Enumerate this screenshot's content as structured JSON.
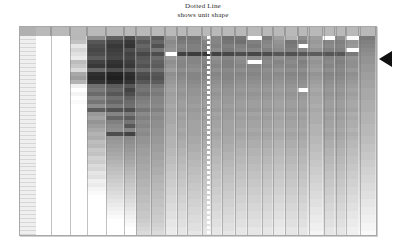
{
  "title": {
    "line1": "Dotted Line",
    "line2": "shows unit shape"
  },
  "marker": {
    "name": "selected-row-pointer",
    "shape": "left-pointing-triangle",
    "color": "#111111",
    "points_at_row_index": 4
  },
  "dotted_line": {
    "label": "unit shape reference line",
    "color": "#ffffff",
    "style": "dotted",
    "orientation": "vertical",
    "position_fraction": 0.502
  },
  "chart_data": {
    "type": "heatmap",
    "title": "Dotted Line shows unit shape",
    "subtitle": "shows unit shape",
    "xlabel": "",
    "ylabel": "",
    "grid": true,
    "legend": "none",
    "colorscale": {
      "name": "grayscale",
      "min_color": "#ffffff",
      "max_color": "#000000",
      "min_value": 0,
      "max_value": 1
    },
    "annotations": [
      "Dotted Line shows unit shape"
    ],
    "column_widths": [
      20,
      26,
      22,
      26,
      24,
      16,
      20,
      18,
      16,
      14,
      20,
      12,
      14,
      18,
      16,
      20,
      14,
      16,
      18,
      14,
      20,
      16,
      14,
      18,
      22
    ],
    "column_labels": [
      "",
      "",
      "",
      "",
      "",
      "",
      "",
      "",
      "",
      "",
      "",
      "",
      "",
      "",
      "",
      "",
      "",
      "",
      "",
      "",
      "",
      "",
      "",
      "",
      ""
    ],
    "row_labels": [
      "",
      "",
      "",
      "",
      "",
      "",
      "",
      "",
      "",
      "",
      "",
      "",
      "",
      "",
      "",
      "",
      "",
      "",
      "",
      "",
      "",
      "",
      "",
      "",
      "",
      "",
      "",
      "",
      "",
      "",
      "",
      "",
      "",
      "",
      "",
      "",
      "",
      "",
      "",
      "",
      "",
      "",
      "",
      "",
      "",
      "",
      "",
      "",
      "",
      ""
    ],
    "values": [
      [
        1.0,
        1.0,
        0.72,
        0.55,
        0.38,
        0.3,
        0.42,
        0.35,
        0.58,
        0.45,
        0.46,
        0.6,
        0.52,
        0.44,
        0.46,
        1.0,
        0.48,
        0.62,
        0.7,
        0.55,
        0.62,
        1.0,
        0.56,
        0.98,
        0.48
      ],
      [
        1.0,
        1.0,
        0.76,
        0.34,
        0.26,
        0.22,
        0.34,
        0.4,
        0.54,
        0.48,
        0.48,
        0.52,
        0.52,
        0.46,
        0.44,
        0.5,
        0.52,
        0.58,
        0.46,
        0.5,
        0.6,
        0.52,
        0.5,
        0.58,
        0.5
      ],
      [
        1.0,
        1.0,
        0.9,
        0.3,
        0.22,
        0.2,
        0.4,
        0.32,
        0.56,
        0.52,
        0.5,
        0.5,
        0.5,
        0.5,
        0.5,
        0.48,
        0.54,
        0.56,
        0.48,
        1.0,
        0.62,
        0.54,
        0.52,
        0.6,
        0.52
      ],
      [
        1.0,
        1.0,
        0.84,
        0.28,
        0.24,
        0.3,
        0.36,
        0.46,
        0.58,
        0.5,
        0.5,
        0.52,
        0.54,
        0.48,
        0.52,
        0.52,
        0.5,
        0.54,
        0.5,
        0.52,
        0.58,
        0.5,
        0.5,
        1.0,
        0.54
      ],
      [
        1.0,
        1.0,
        0.88,
        0.3,
        0.26,
        0.26,
        0.28,
        0.3,
        1.0,
        0.26,
        0.24,
        0.22,
        0.26,
        0.28,
        0.3,
        0.28,
        0.3,
        0.34,
        0.32,
        0.34,
        0.36,
        0.34,
        0.34,
        0.48,
        0.56
      ],
      [
        1.0,
        1.0,
        0.92,
        0.36,
        0.28,
        0.28,
        0.34,
        0.42,
        0.6,
        0.54,
        0.52,
        0.54,
        0.56,
        0.52,
        0.56,
        0.54,
        0.52,
        0.56,
        0.52,
        0.54,
        0.6,
        0.52,
        0.52,
        0.58,
        0.58
      ],
      [
        1.0,
        1.0,
        0.74,
        0.26,
        0.2,
        0.24,
        0.36,
        0.38,
        0.56,
        0.52,
        0.52,
        0.52,
        0.54,
        0.5,
        0.54,
        1.0,
        0.54,
        0.52,
        0.54,
        0.5,
        0.58,
        0.54,
        0.5,
        0.56,
        0.58
      ],
      [
        1.0,
        1.0,
        0.78,
        0.22,
        0.18,
        0.22,
        0.32,
        0.36,
        0.58,
        0.52,
        0.54,
        0.5,
        0.52,
        0.5,
        0.52,
        0.52,
        0.52,
        0.54,
        0.52,
        0.52,
        0.6,
        0.52,
        0.52,
        0.56,
        0.6
      ],
      [
        1.0,
        1.0,
        0.86,
        0.4,
        0.3,
        0.34,
        0.42,
        0.44,
        0.62,
        0.56,
        0.56,
        0.54,
        0.56,
        0.54,
        0.56,
        0.54,
        0.56,
        0.58,
        0.56,
        0.56,
        0.62,
        0.56,
        0.54,
        0.6,
        0.6
      ],
      [
        1.0,
        1.0,
        0.66,
        0.18,
        0.14,
        0.18,
        0.3,
        0.34,
        0.56,
        0.52,
        0.52,
        0.52,
        0.52,
        0.52,
        0.52,
        0.52,
        0.54,
        0.54,
        0.52,
        0.52,
        0.58,
        0.52,
        0.52,
        0.56,
        0.62
      ],
      [
        1.0,
        1.0,
        0.62,
        0.16,
        0.12,
        0.16,
        0.28,
        0.32,
        0.58,
        0.54,
        0.52,
        0.54,
        0.54,
        0.52,
        0.54,
        0.54,
        0.54,
        0.56,
        0.54,
        0.54,
        0.6,
        0.54,
        0.54,
        0.58,
        0.62
      ],
      [
        1.0,
        1.0,
        0.7,
        0.2,
        0.16,
        0.2,
        0.34,
        0.36,
        0.6,
        0.56,
        0.54,
        0.56,
        0.56,
        0.54,
        0.56,
        0.56,
        0.56,
        0.58,
        0.56,
        0.56,
        0.62,
        0.56,
        0.56,
        0.6,
        0.64
      ],
      [
        1.0,
        1.0,
        0.94,
        0.44,
        0.36,
        0.34,
        0.44,
        0.46,
        0.62,
        0.58,
        0.56,
        0.58,
        0.58,
        0.56,
        0.58,
        0.58,
        0.58,
        0.6,
        0.58,
        0.58,
        0.64,
        0.58,
        0.58,
        0.62,
        0.64
      ],
      [
        1.0,
        1.0,
        1.0,
        0.48,
        0.4,
        0.26,
        0.46,
        0.5,
        0.64,
        0.6,
        0.58,
        0.6,
        0.6,
        0.58,
        0.6,
        0.6,
        0.6,
        0.62,
        0.6,
        1.0,
        0.66,
        0.6,
        0.6,
        0.64,
        0.66
      ],
      [
        1.0,
        1.0,
        0.96,
        0.42,
        0.34,
        0.3,
        0.42,
        0.48,
        0.62,
        0.58,
        0.58,
        0.58,
        0.58,
        0.58,
        0.58,
        0.58,
        0.58,
        0.6,
        0.58,
        0.58,
        0.64,
        0.58,
        0.58,
        0.62,
        0.66
      ],
      [
        1.0,
        1.0,
        1.0,
        0.52,
        0.44,
        0.38,
        0.48,
        0.52,
        0.64,
        0.6,
        0.6,
        0.6,
        0.6,
        0.6,
        0.6,
        0.6,
        0.6,
        0.62,
        0.6,
        0.6,
        0.66,
        0.6,
        0.6,
        0.64,
        0.66
      ],
      [
        1.0,
        1.0,
        0.98,
        0.46,
        0.4,
        0.42,
        0.5,
        0.52,
        0.64,
        0.62,
        0.6,
        0.62,
        0.62,
        0.6,
        0.62,
        0.62,
        0.62,
        0.64,
        0.62,
        0.62,
        0.66,
        0.62,
        0.62,
        0.66,
        0.68
      ],
      [
        1.0,
        1.0,
        1.0,
        0.56,
        0.48,
        0.44,
        0.52,
        0.54,
        0.66,
        0.62,
        0.62,
        0.62,
        0.62,
        0.62,
        0.62,
        0.62,
        0.62,
        0.64,
        0.62,
        0.62,
        0.68,
        0.62,
        0.62,
        0.66,
        0.68
      ],
      [
        1.0,
        1.0,
        1.0,
        0.36,
        0.32,
        0.3,
        0.46,
        0.5,
        0.64,
        0.6,
        0.6,
        0.6,
        0.6,
        0.6,
        0.6,
        0.6,
        0.6,
        0.62,
        0.6,
        0.6,
        0.66,
        0.6,
        0.6,
        0.64,
        0.68
      ],
      [
        1.0,
        1.0,
        1.0,
        0.6,
        0.52,
        0.48,
        0.54,
        0.56,
        0.66,
        0.64,
        0.62,
        0.64,
        0.64,
        0.62,
        0.64,
        0.64,
        0.64,
        0.66,
        0.64,
        0.64,
        0.68,
        0.64,
        0.64,
        0.68,
        0.7
      ],
      [
        1.0,
        1.0,
        1.0,
        0.64,
        0.4,
        0.36,
        0.5,
        0.54,
        0.66,
        0.62,
        0.62,
        0.62,
        0.62,
        0.62,
        0.62,
        0.62,
        0.62,
        0.64,
        0.62,
        0.62,
        0.68,
        0.62,
        0.62,
        0.66,
        0.7
      ],
      [
        1.0,
        1.0,
        1.0,
        0.58,
        0.5,
        0.46,
        0.54,
        0.56,
        0.66,
        0.64,
        0.64,
        0.64,
        0.64,
        0.64,
        0.64,
        0.64,
        0.64,
        0.66,
        0.64,
        0.64,
        0.68,
        0.64,
        0.64,
        0.68,
        0.7
      ],
      [
        1.0,
        1.0,
        1.0,
        0.62,
        0.54,
        0.34,
        0.52,
        0.56,
        0.68,
        0.64,
        0.64,
        0.64,
        0.64,
        0.64,
        0.64,
        0.64,
        0.64,
        0.66,
        0.64,
        0.64,
        0.7,
        0.64,
        0.64,
        0.68,
        0.72
      ],
      [
        1.0,
        1.0,
        1.0,
        0.66,
        0.56,
        0.52,
        0.56,
        0.58,
        0.68,
        0.66,
        0.64,
        0.66,
        0.66,
        0.64,
        0.66,
        0.66,
        0.66,
        0.68,
        0.66,
        0.66,
        0.7,
        0.66,
        0.66,
        0.7,
        0.72
      ],
      [
        1.0,
        1.0,
        1.0,
        0.7,
        0.3,
        0.26,
        0.54,
        0.58,
        0.68,
        0.64,
        0.64,
        0.64,
        0.64,
        0.64,
        0.64,
        0.64,
        0.64,
        0.66,
        0.64,
        0.64,
        0.7,
        0.64,
        0.64,
        0.68,
        0.72
      ],
      [
        1.0,
        1.0,
        1.0,
        0.68,
        0.58,
        0.54,
        0.58,
        0.6,
        0.7,
        0.66,
        0.66,
        0.66,
        0.66,
        0.66,
        0.66,
        0.66,
        0.66,
        0.68,
        0.66,
        0.66,
        0.72,
        0.66,
        0.66,
        0.7,
        0.74
      ],
      [
        1.0,
        1.0,
        1.0,
        0.74,
        0.6,
        0.56,
        0.58,
        0.6,
        0.7,
        0.68,
        0.66,
        0.68,
        0.68,
        0.66,
        0.68,
        0.68,
        0.68,
        0.7,
        0.68,
        0.68,
        0.72,
        0.68,
        0.68,
        0.72,
        0.74
      ],
      [
        1.0,
        1.0,
        1.0,
        0.72,
        0.62,
        0.58,
        0.6,
        0.62,
        0.7,
        0.68,
        0.68,
        0.68,
        0.68,
        0.68,
        0.68,
        0.68,
        0.68,
        0.7,
        0.68,
        0.68,
        0.74,
        0.68,
        0.68,
        0.72,
        0.76
      ],
      [
        1.0,
        1.0,
        1.0,
        0.78,
        0.64,
        0.6,
        0.62,
        0.62,
        0.72,
        0.7,
        0.68,
        0.7,
        0.7,
        0.68,
        0.7,
        0.7,
        0.7,
        0.72,
        0.7,
        0.7,
        0.74,
        0.7,
        0.7,
        0.74,
        0.76
      ],
      [
        1.0,
        1.0,
        1.0,
        0.76,
        0.66,
        0.62,
        0.62,
        0.64,
        0.72,
        0.7,
        0.7,
        0.7,
        0.7,
        0.7,
        0.7,
        0.7,
        0.7,
        0.72,
        0.7,
        0.7,
        0.76,
        0.7,
        0.7,
        0.74,
        0.78
      ],
      [
        1.0,
        1.0,
        1.0,
        0.82,
        0.68,
        0.64,
        0.64,
        0.64,
        0.74,
        0.72,
        0.7,
        0.72,
        0.72,
        0.7,
        0.72,
        0.72,
        0.72,
        0.74,
        0.72,
        0.72,
        0.76,
        0.72,
        0.72,
        0.76,
        0.78
      ],
      [
        1.0,
        1.0,
        1.0,
        0.8,
        0.7,
        0.66,
        0.64,
        0.66,
        0.74,
        0.72,
        0.72,
        0.72,
        0.72,
        0.72,
        0.72,
        0.72,
        0.72,
        0.74,
        0.72,
        0.72,
        0.78,
        0.72,
        0.72,
        0.76,
        0.8
      ],
      [
        1.0,
        1.0,
        1.0,
        0.86,
        0.72,
        0.68,
        0.66,
        0.66,
        0.76,
        0.74,
        0.72,
        0.74,
        0.74,
        0.72,
        0.74,
        0.74,
        0.74,
        0.76,
        0.74,
        0.74,
        0.78,
        0.74,
        0.74,
        0.78,
        0.8
      ],
      [
        1.0,
        1.0,
        1.0,
        0.84,
        0.74,
        0.7,
        0.66,
        0.68,
        0.76,
        0.74,
        0.74,
        0.74,
        0.74,
        0.74,
        0.74,
        0.74,
        0.74,
        0.76,
        0.74,
        0.74,
        0.8,
        0.74,
        0.74,
        0.78,
        0.82
      ],
      [
        1.0,
        1.0,
        1.0,
        0.9,
        0.76,
        0.72,
        0.68,
        0.68,
        0.78,
        0.76,
        0.74,
        0.76,
        0.76,
        0.74,
        0.76,
        0.76,
        0.76,
        0.78,
        0.76,
        0.76,
        0.8,
        0.76,
        0.76,
        0.8,
        0.82
      ],
      [
        1.0,
        1.0,
        1.0,
        0.88,
        0.78,
        0.74,
        0.68,
        0.7,
        0.78,
        0.76,
        0.76,
        0.76,
        0.76,
        0.76,
        0.76,
        0.76,
        0.76,
        0.78,
        0.76,
        0.76,
        0.82,
        0.76,
        0.76,
        0.8,
        0.84
      ],
      [
        1.0,
        1.0,
        1.0,
        0.94,
        0.8,
        0.76,
        0.7,
        0.7,
        0.8,
        0.78,
        0.76,
        0.78,
        0.78,
        0.76,
        0.78,
        0.78,
        0.78,
        0.8,
        0.78,
        0.78,
        0.82,
        0.78,
        0.78,
        0.82,
        0.84
      ],
      [
        1.0,
        1.0,
        1.0,
        0.92,
        0.82,
        0.78,
        0.7,
        0.72,
        0.8,
        0.78,
        0.78,
        0.78,
        0.78,
        0.78,
        0.78,
        0.78,
        0.78,
        0.8,
        0.78,
        0.78,
        0.84,
        0.78,
        0.78,
        0.82,
        0.86
      ],
      [
        1.0,
        1.0,
        1.0,
        0.96,
        0.84,
        0.8,
        0.72,
        0.72,
        0.82,
        0.8,
        0.78,
        0.8,
        0.8,
        0.78,
        0.8,
        0.8,
        0.8,
        0.82,
        0.8,
        0.8,
        0.84,
        0.8,
        0.8,
        0.84,
        0.86
      ],
      [
        1.0,
        1.0,
        1.0,
        0.98,
        0.86,
        0.82,
        0.72,
        0.74,
        0.82,
        0.8,
        0.8,
        0.8,
        0.8,
        0.8,
        0.8,
        0.8,
        0.8,
        0.82,
        0.8,
        0.8,
        0.86,
        0.8,
        0.8,
        0.84,
        0.88
      ],
      [
        1.0,
        1.0,
        1.0,
        1.0,
        0.88,
        0.84,
        0.74,
        0.74,
        0.84,
        0.82,
        0.8,
        0.82,
        0.82,
        0.8,
        0.82,
        0.82,
        0.82,
        0.84,
        0.82,
        0.82,
        0.86,
        0.82,
        0.82,
        0.86,
        0.88
      ],
      [
        1.0,
        1.0,
        1.0,
        1.0,
        0.9,
        0.86,
        0.74,
        0.76,
        0.84,
        0.82,
        0.82,
        0.82,
        0.82,
        0.82,
        0.82,
        0.82,
        0.82,
        0.84,
        0.82,
        0.82,
        0.88,
        0.82,
        0.82,
        0.86,
        0.9
      ],
      [
        1.0,
        1.0,
        1.0,
        1.0,
        0.92,
        0.88,
        0.76,
        0.76,
        0.86,
        0.84,
        0.82,
        0.84,
        0.84,
        0.82,
        0.84,
        0.84,
        0.84,
        0.86,
        0.84,
        0.84,
        0.88,
        0.84,
        0.84,
        0.88,
        0.9
      ],
      [
        1.0,
        1.0,
        1.0,
        1.0,
        0.94,
        0.9,
        0.76,
        0.78,
        0.86,
        0.84,
        0.84,
        0.84,
        0.84,
        0.84,
        0.84,
        0.84,
        0.84,
        0.86,
        0.84,
        0.84,
        0.9,
        0.84,
        0.84,
        0.88,
        0.92
      ],
      [
        1.0,
        1.0,
        1.0,
        1.0,
        0.96,
        0.92,
        0.78,
        0.78,
        0.88,
        0.86,
        0.84,
        0.86,
        0.86,
        0.84,
        0.86,
        0.86,
        0.86,
        0.88,
        0.86,
        0.86,
        0.9,
        0.86,
        0.86,
        0.9,
        0.92
      ],
      [
        1.0,
        1.0,
        1.0,
        1.0,
        0.98,
        0.94,
        0.78,
        0.8,
        0.88,
        0.86,
        0.86,
        0.86,
        0.86,
        0.86,
        0.86,
        0.86,
        0.86,
        0.88,
        0.86,
        0.86,
        0.92,
        0.86,
        0.86,
        0.9,
        0.94
      ],
      [
        1.0,
        1.0,
        1.0,
        1.0,
        1.0,
        0.96,
        0.8,
        0.8,
        0.9,
        0.88,
        0.86,
        0.88,
        0.88,
        0.86,
        0.88,
        0.88,
        0.88,
        0.9,
        0.88,
        0.88,
        0.92,
        0.88,
        0.88,
        0.92,
        0.94
      ],
      [
        1.0,
        1.0,
        1.0,
        1.0,
        1.0,
        0.98,
        0.82,
        0.82,
        0.9,
        0.88,
        0.88,
        0.88,
        0.88,
        0.88,
        0.88,
        0.88,
        0.88,
        0.9,
        0.88,
        0.88,
        0.94,
        0.88,
        0.88,
        0.92,
        0.96
      ],
      [
        1.0,
        1.0,
        1.0,
        1.0,
        1.0,
        1.0,
        0.84,
        0.84,
        0.92,
        0.9,
        0.88,
        0.9,
        0.9,
        0.88,
        0.9,
        0.9,
        0.9,
        0.92,
        0.9,
        0.9,
        0.94,
        0.9,
        0.9,
        0.94,
        0.96
      ],
      [
        1.0,
        1.0,
        1.0,
        1.0,
        1.0,
        1.0,
        0.86,
        0.86,
        0.92,
        0.9,
        0.9,
        0.9,
        0.9,
        0.9,
        0.9,
        0.9,
        0.9,
        0.92,
        0.9,
        0.9,
        0.96,
        0.9,
        0.9,
        0.94,
        0.98
      ]
    ]
  }
}
